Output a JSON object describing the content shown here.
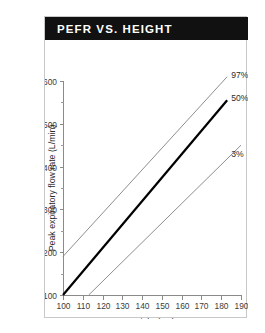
{
  "figure": {
    "title": "PEFR VS. HEIGHT",
    "title_bg": "#111111",
    "title_color": "#ffffff",
    "border_color": "#c8c8c8"
  },
  "chart_data": {
    "type": "line",
    "title": "PEFR VS. HEIGHT",
    "xlabel": "Height (cm)",
    "ylabel": "Peak expiratory flow rate (L/min)",
    "xlim": [
      100,
      190
    ],
    "ylim": [
      100,
      600
    ],
    "xticks": [
      100,
      110,
      120,
      130,
      140,
      150,
      160,
      170,
      180,
      190
    ],
    "xtick_labels": [
      "100",
      "110",
      "120",
      "130",
      "140",
      "150",
      "160",
      "170",
      "180",
      "190"
    ],
    "yticks": [
      100,
      200,
      300,
      400,
      500,
      600
    ],
    "ytick_labels": [
      "100",
      "200",
      "300",
      "400",
      "500",
      "600"
    ],
    "yticks_minor": [
      150,
      250,
      350,
      450,
      550
    ],
    "grid": false,
    "legend_position": "right-inline-labels",
    "series": [
      {
        "name": "97%",
        "label": "97%",
        "color": "#8e8e8e",
        "width": "thin",
        "x": [
          100,
          183
        ],
        "y": [
          190,
          610
        ]
      },
      {
        "name": "50%",
        "label": "50%",
        "color": "#000000",
        "width": "thick",
        "x": [
          100,
          183
        ],
        "y": [
          100,
          555
        ]
      },
      {
        "name": "3%",
        "label": "3%",
        "color": "#8e8e8e",
        "width": "thin",
        "x": [
          113,
          190
        ],
        "y": [
          100,
          450
        ]
      }
    ],
    "annotations": [
      {
        "text": "97%",
        "x": 184,
        "y": 615
      },
      {
        "text": "50%",
        "x": 184,
        "y": 560
      },
      {
        "text": "3%",
        "x": 184,
        "y": 430
      }
    ]
  }
}
